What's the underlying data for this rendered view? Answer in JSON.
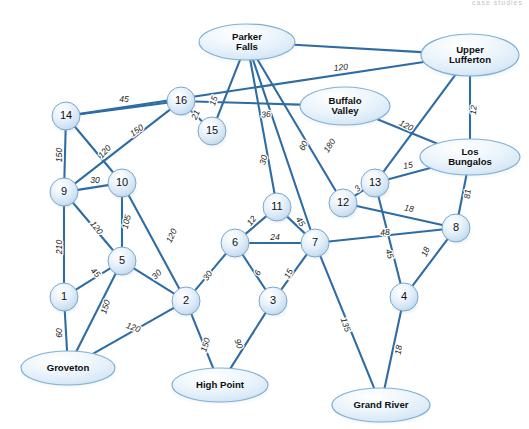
{
  "figure": {
    "kind": "weighted-network-graph",
    "cropped_header_text": "case studies",
    "width": 529,
    "height": 429
  },
  "colors": {
    "edge": "#2e6ca4",
    "node_fill_light": "#f4f9fd",
    "node_fill_mid": "#cfe2f2",
    "node_stroke": "#7aa7cb",
    "city_fill": "#e6f1fa",
    "city_stroke": "#7fb0d4",
    "label_text": "#1b1b1b",
    "background": "#ffffff"
  },
  "chart_data": {
    "type": "diagram",
    "title": "",
    "nodes": [
      {
        "id": "1",
        "label": "1",
        "type": "numbered",
        "x": 64,
        "y": 297,
        "r": 14
      },
      {
        "id": "2",
        "label": "2",
        "type": "numbered",
        "x": 186,
        "y": 301,
        "r": 14
      },
      {
        "id": "3",
        "label": "3",
        "type": "numbered",
        "x": 273,
        "y": 301,
        "r": 14
      },
      {
        "id": "4",
        "label": "4",
        "type": "numbered",
        "x": 404,
        "y": 297,
        "r": 14
      },
      {
        "id": "5",
        "label": "5",
        "type": "numbered",
        "x": 122,
        "y": 261,
        "r": 14
      },
      {
        "id": "6",
        "label": "6",
        "type": "numbered",
        "x": 235,
        "y": 243,
        "r": 14
      },
      {
        "id": "7",
        "label": "7",
        "type": "numbered",
        "x": 315,
        "y": 243,
        "r": 14
      },
      {
        "id": "8",
        "label": "8",
        "type": "numbered",
        "x": 456,
        "y": 228,
        "r": 14
      },
      {
        "id": "9",
        "label": "9",
        "type": "numbered",
        "x": 64,
        "y": 192,
        "r": 14
      },
      {
        "id": "10",
        "label": "10",
        "type": "numbered",
        "x": 122,
        "y": 183,
        "r": 14
      },
      {
        "id": "11",
        "label": "11",
        "type": "numbered",
        "x": 277,
        "y": 207,
        "r": 14
      },
      {
        "id": "12",
        "label": "12",
        "type": "numbered",
        "x": 343,
        "y": 203,
        "r": 14
      },
      {
        "id": "13",
        "label": "13",
        "type": "numbered",
        "x": 375,
        "y": 183,
        "r": 14
      },
      {
        "id": "14",
        "label": "14",
        "type": "numbered",
        "x": 66,
        "y": 116,
        "r": 14
      },
      {
        "id": "15",
        "label": "15",
        "type": "numbered",
        "x": 212,
        "y": 131,
        "r": 14
      },
      {
        "id": "16",
        "label": "16",
        "type": "numbered",
        "x": 181,
        "y": 101,
        "r": 14
      },
      {
        "id": "parker_falls",
        "label": "Parker\nFalls",
        "type": "city",
        "x": 247,
        "y": 42,
        "rx": 48,
        "ry": 18
      },
      {
        "id": "upper_lufferton",
        "label": "Upper\nLufferton",
        "type": "city",
        "x": 470,
        "y": 55,
        "rx": 49,
        "ry": 21
      },
      {
        "id": "buffalo_valley",
        "label": "Buffalo\nValley",
        "type": "city",
        "x": 345,
        "y": 106,
        "rx": 45,
        "ry": 19
      },
      {
        "id": "los_bungalos",
        "label": "Los\nBungalos",
        "type": "city",
        "x": 470,
        "y": 157,
        "rx": 50,
        "ry": 18
      },
      {
        "id": "groveton",
        "label": "Groveton",
        "type": "city",
        "x": 68,
        "y": 368,
        "rx": 47,
        "ry": 17
      },
      {
        "id": "high_point",
        "label": "High Point",
        "type": "city",
        "x": 220,
        "y": 385,
        "rx": 48,
        "ry": 17
      },
      {
        "id": "grand_river",
        "label": "Grand River",
        "type": "city",
        "x": 381,
        "y": 405,
        "rx": 49,
        "ry": 17
      }
    ],
    "edges": [
      {
        "from": "14",
        "to": "16",
        "weight": "45",
        "lx": 124,
        "ly": 100,
        "rot": 0
      },
      {
        "from": "14",
        "to": "9",
        "weight": "150",
        "lx": 60,
        "ly": 155,
        "rot": -90
      },
      {
        "from": "14",
        "to": "10",
        "weight": "120",
        "lx": 105,
        "ly": 152,
        "rot": -48
      },
      {
        "from": "16",
        "to": "9",
        "weight": "150",
        "lx": 137,
        "ly": 131,
        "rot": -35
      },
      {
        "from": "16",
        "to": "15",
        "weight": "21",
        "lx": 196,
        "ly": 115,
        "rot": -66
      },
      {
        "from": "9",
        "to": "10",
        "weight": "30",
        "lx": 95,
        "ly": 181,
        "rot": 0
      },
      {
        "from": "9",
        "to": "5",
        "weight": "120",
        "lx": 96,
        "ly": 228,
        "rot": 53
      },
      {
        "from": "9",
        "to": "1",
        "weight": "210",
        "lx": 60,
        "ly": 247,
        "rot": -90
      },
      {
        "from": "10",
        "to": "5",
        "weight": "105",
        "lx": 127,
        "ly": 222,
        "rot": -76
      },
      {
        "from": "10",
        "to": "2",
        "weight": "120",
        "lx": 172,
        "ly": 236,
        "rot": -64
      },
      {
        "from": "5",
        "to": "1",
        "weight": "45",
        "lx": 95,
        "ly": 273,
        "rot": 44
      },
      {
        "from": "5",
        "to": "2",
        "weight": "30",
        "lx": 157,
        "ly": 275,
        "rot": -46
      },
      {
        "from": "5",
        "to": "groveton",
        "weight": "150",
        "lx": 106,
        "ly": 307,
        "rot": -73
      },
      {
        "from": "1",
        "to": "groveton",
        "weight": "60",
        "lx": 60,
        "ly": 333,
        "rot": -90
      },
      {
        "from": "2",
        "to": "groveton",
        "weight": "120",
        "lx": 133,
        "ly": 328,
        "rot": 20
      },
      {
        "from": "2",
        "to": "6",
        "weight": "30",
        "lx": 208,
        "ly": 276,
        "rot": -56
      },
      {
        "from": "2",
        "to": "high_point",
        "weight": "150",
        "lx": 206,
        "ly": 345,
        "rot": -73
      },
      {
        "from": "3",
        "to": "high_point",
        "weight": "90",
        "lx": 238,
        "ly": 344,
        "rot": 69
      },
      {
        "from": "3",
        "to": "6",
        "weight": "6",
        "lx": 258,
        "ly": 273,
        "rot": -62
      },
      {
        "from": "3",
        "to": "7",
        "weight": "15",
        "lx": 289,
        "ly": 274,
        "rot": -62
      },
      {
        "from": "6",
        "to": "7",
        "weight": "24",
        "lx": 275,
        "ly": 238,
        "rot": 0
      },
      {
        "from": "6",
        "to": "11",
        "weight": "12",
        "lx": 252,
        "ly": 221,
        "rot": -51
      },
      {
        "from": "11",
        "to": "7",
        "weight": "45",
        "lx": 300,
        "ly": 222,
        "rot": 56
      },
      {
        "from": "7",
        "to": "8",
        "weight": "48",
        "lx": 385,
        "ly": 233,
        "rot": -6
      },
      {
        "from": "7",
        "to": "grand_river",
        "weight": "135",
        "lx": 345,
        "ly": 325,
        "rot": 70
      },
      {
        "from": "12",
        "to": "13",
        "weight": "3",
        "lx": 358,
        "ly": 189,
        "rot": -44
      },
      {
        "from": "12",
        "to": "8",
        "weight": "18",
        "lx": 409,
        "ly": 209,
        "rot": 11
      },
      {
        "from": "13",
        "to": "4",
        "weight": "45",
        "lx": 389,
        "ly": 254,
        "rot": 71
      },
      {
        "from": "13",
        "to": "los_bungalos",
        "weight": "15",
        "lx": 408,
        "ly": 166,
        "rot": -10
      },
      {
        "from": "4",
        "to": "8",
        "weight": "18",
        "lx": 426,
        "ly": 252,
        "rot": -66
      },
      {
        "from": "4",
        "to": "grand_river",
        "weight": "18",
        "lx": 399,
        "ly": 350,
        "rot": -81
      },
      {
        "from": "8",
        "to": "los_bungalos",
        "weight": "81",
        "lx": 468,
        "ly": 194,
        "rot": -84
      },
      {
        "from": "upper_lufferton",
        "to": "los_bungalos",
        "weight": "12",
        "lx": 474,
        "ly": 110,
        "rot": -84
      },
      {
        "from": "parker_falls",
        "to": "upper_lufferton",
        "weight": "120",
        "lx": 341,
        "ly": 68,
        "rot": -6
      },
      {
        "from": "parker_falls",
        "to": "15",
        "weight": "15",
        "lx": 214,
        "ly": 101,
        "rot": -72
      },
      {
        "from": "parker_falls",
        "to": "11",
        "weight": "30",
        "lx": 264,
        "ly": 160,
        "rot": -76
      },
      {
        "from": "parker_falls",
        "to": "12",
        "weight": "60",
        "lx": 304,
        "ly": 146,
        "rot": -65
      },
      {
        "from": "parker_falls",
        "to": "7",
        "weight": "180",
        "lx": 330,
        "ly": 146,
        "rot": -57
      },
      {
        "from": "buffalo_valley",
        "to": "16",
        "weight": "36",
        "lx": 266,
        "ly": 115,
        "rot": -6
      },
      {
        "from": "buffalo_valley",
        "to": "los_bungalos",
        "weight": "120",
        "lx": 406,
        "ly": 126,
        "rot": 27
      },
      {
        "from": "upper_lufferton",
        "to": "13",
        "weight": "",
        "lx": 0,
        "ly": 0,
        "rot": 0
      },
      {
        "from": "upper_lufferton",
        "to": "14",
        "weight": "",
        "lx": 0,
        "ly": 0,
        "rot": 0
      }
    ]
  }
}
